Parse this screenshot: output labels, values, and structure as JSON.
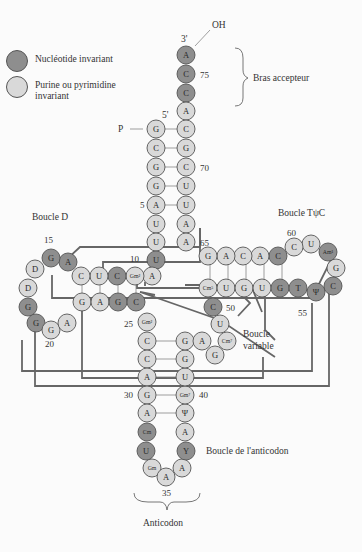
{
  "colors": {
    "invariant": "#8e8e8e",
    "semi_invariant": "#d9d9d9",
    "outline": "#555555",
    "tertiary_line": "#666666"
  },
  "legend": [
    {
      "label": "Nucléotide invariant",
      "shade": "dark"
    },
    {
      "label": "Purine ou pyrimidine invariant",
      "shade": "light"
    }
  ],
  "labels": {
    "oh": "OH",
    "three_prime": "3'",
    "five_prime": "5'",
    "phosphate": "P",
    "acceptor_arm": "Bras accepteur",
    "d_loop": "Boucle D",
    "tpsic_loop": "Boucle TψC",
    "variable_loop_1": "Boucle",
    "variable_loop_2": "variable",
    "anticodon_loop": "Boucle de l'anticodon",
    "anticodon": "Anticodon"
  },
  "position_numbers": {
    "n5": "5",
    "n10": "10",
    "n15": "15",
    "n20": "20",
    "n25": "25",
    "n30": "30",
    "n35": "35",
    "n40": "40",
    "n50": "50",
    "n55": "55",
    "n60": "60",
    "n65": "65",
    "n70": "70",
    "n75": "75"
  },
  "nucleotides": {
    "acc_3_A": "A",
    "acc_C75": "C",
    "acc_C74": "C",
    "acc_A73": "A",
    "a1": "G",
    "a2": "C",
    "a3": "G",
    "a4": "G",
    "a5": "A",
    "a6": "U",
    "a7": "U",
    "a72": "C",
    "a71": "G",
    "a70": "C",
    "a69": "U",
    "a68": "U",
    "a67": "A",
    "a66": "A",
    "u8": "U",
    "a9": "A",
    "d10": "Gm²",
    "d11": "C",
    "d12": "U",
    "d13": "C",
    "d14": "A",
    "d15": "G",
    "d16": "D",
    "d17": "D",
    "d18": "G",
    "d19": "G",
    "d20": "G",
    "d21": "A",
    "d22": "G",
    "d23": "A",
    "d24": "G",
    "d25": "C",
    "n26": "Gm²",
    "ac27": "C",
    "ac28": "C",
    "ac29": "A",
    "ac30": "G",
    "ac31": "A",
    "ac32": "Cm",
    "ac33": "U",
    "ac34": "Gm",
    "ac35": "A",
    "ac36": "A",
    "ac37": "Y",
    "ac38": "A",
    "ac39": "Ψ",
    "ac40": "Gm⁷",
    "ac41": "U",
    "ac42": "G",
    "ac43": "G",
    "v44": "A",
    "v45": "G",
    "v46": "Cm⁷",
    "v47": "U",
    "v48": "C",
    "t49": "Cm⁵",
    "t50": "U",
    "t51": "G",
    "t52": "U",
    "t53": "G",
    "t54": "T",
    "t55": "Ψ",
    "t56": "C",
    "t57": "G",
    "t58": "Am¹",
    "t59": "U",
    "t60": "C",
    "t61": "C",
    "t62": "A",
    "t63": "C",
    "t64": "A",
    "t65": "G"
  }
}
